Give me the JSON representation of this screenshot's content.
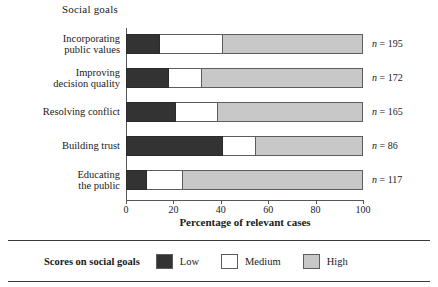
{
  "chart_data": {
    "type": "bar",
    "subtype": "stacked-horizontal-bar",
    "title": "Social goals",
    "xlabel": "Percentage of relevant cases",
    "ylabel": "",
    "xlim": [
      0,
      100
    ],
    "xticks": [
      0,
      20,
      40,
      60,
      80,
      100
    ],
    "xtick_labels": [
      "0",
      "20",
      "40",
      "60",
      "80",
      "100"
    ],
    "grid": false,
    "legend_position": "bottom",
    "legend_title": "Scores on social goals",
    "categories": [
      "Incorporating\npublic values",
      "Improving\ndecision quality",
      "Resolving conflict",
      "Building trust",
      "Educating\nthe public"
    ],
    "series": [
      {
        "name": "Low",
        "color": "#333333",
        "values": [
          14.5,
          18,
          21,
          41,
          9
        ]
      },
      {
        "name": "Medium",
        "color": "#ffffff",
        "values": [
          26.5,
          14,
          18,
          14,
          15
        ]
      },
      {
        "name": "High",
        "color": "#c8c8c8",
        "values": [
          59,
          68,
          61,
          45,
          76
        ]
      }
    ],
    "annotations": [
      "n = 195",
      "n = 172",
      "n = 165",
      "n = 86",
      "n = 117"
    ]
  },
  "rows": [
    {
      "category": "Incorporating\npublic values",
      "low": 14.5,
      "medium": 26.5,
      "high": 59,
      "n_prefix": "n",
      "n_value": "= 195"
    },
    {
      "category": "Improving\ndecision quality",
      "low": 18,
      "medium": 14,
      "high": 68,
      "n_prefix": "n",
      "n_value": "= 172"
    },
    {
      "category": "Resolving conflict",
      "low": 21,
      "medium": 18,
      "high": 61,
      "n_prefix": "n",
      "n_value": "= 165"
    },
    {
      "category": "Building trust",
      "low": 41,
      "medium": 14,
      "high": 45,
      "n_prefix": "n",
      "n_value": "= 86"
    },
    {
      "category": "Educating\nthe public",
      "low": 9,
      "medium": 15,
      "high": 76,
      "n_prefix": "n",
      "n_value": "= 117"
    }
  ],
  "axis": {
    "ticks": [
      "0",
      "20",
      "40",
      "60",
      "80",
      "100"
    ],
    "title": "Percentage of relevant cases"
  },
  "legend": {
    "caption": "Scores on social goals",
    "items": [
      {
        "label": "Low",
        "color": "#333333"
      },
      {
        "label": "Medium",
        "color": "#ffffff"
      },
      {
        "label": "High",
        "color": "#c8c8c8"
      }
    ]
  }
}
